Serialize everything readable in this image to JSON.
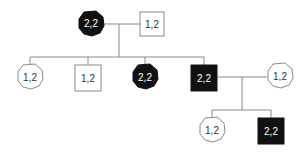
{
  "diagram": {
    "type": "pedigree",
    "generations": [
      {
        "gen": 1,
        "individuals": [
          {
            "id": "g1-mother",
            "sex": "female",
            "affected": true,
            "genotype": "2,2"
          },
          {
            "id": "g1-father",
            "sex": "male",
            "affected": false,
            "genotype": "1,2"
          }
        ]
      },
      {
        "gen": 2,
        "individuals": [
          {
            "id": "g2-daughter-1",
            "sex": "female",
            "affected": false,
            "genotype": "1,2"
          },
          {
            "id": "g2-son-1",
            "sex": "male",
            "affected": false,
            "genotype": "1,2"
          },
          {
            "id": "g2-daughter-2",
            "sex": "female",
            "affected": true,
            "genotype": "2,2"
          },
          {
            "id": "g2-son-2",
            "sex": "male",
            "affected": true,
            "genotype": "2,2"
          },
          {
            "id": "g2-spouse",
            "sex": "female",
            "affected": false,
            "genotype": "1,2"
          }
        ]
      },
      {
        "gen": 3,
        "individuals": [
          {
            "id": "g3-daughter",
            "sex": "female",
            "affected": false,
            "genotype": "1,2"
          },
          {
            "id": "g3-son",
            "sex": "male",
            "affected": true,
            "genotype": "2,2"
          }
        ]
      }
    ],
    "labels": {
      "g1_mother": "2,2",
      "g1_father": "1,2",
      "g2_daughter_1": "1,2",
      "g2_son_1": "1,2",
      "g2_daughter_2": "2,2",
      "g2_son_2": "2,2",
      "g2_spouse": "1,2",
      "g3_daughter": "1,2",
      "g3_son": "2,2"
    },
    "colors": {
      "affected_fill": "#111111",
      "unaffected_fill": "#ffffff",
      "line": "#8a8a8a"
    }
  }
}
